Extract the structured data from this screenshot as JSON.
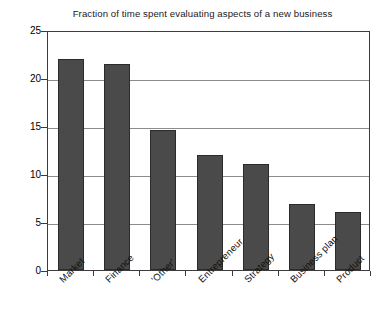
{
  "chart_data": {
    "type": "bar",
    "title": "Fraction of time spent evaluating aspects of a new business",
    "xlabel": "",
    "ylabel": "",
    "categories": [
      "Market",
      "Finance",
      "'Other'",
      "Entrepreneur",
      "Strategy",
      "Business plan",
      "Product"
    ],
    "values": [
      22,
      21.5,
      14.6,
      12,
      11,
      6.9,
      6
    ],
    "ylim": [
      0,
      25
    ],
    "yticks": [
      0,
      5,
      10,
      15,
      20,
      25
    ],
    "ytick_labels": [
      "0",
      "5",
      "10",
      "15",
      "20",
      "25"
    ],
    "grid": true,
    "grid_axis": "y",
    "legend": false,
    "bar_color": "#4a4a4a",
    "bar_edge_color": "#2b2b2b",
    "axis_color": "#3c3c3c",
    "grid_color": "#8c8c8c",
    "background_color": "#ffffff",
    "label_rotation": -45
  }
}
